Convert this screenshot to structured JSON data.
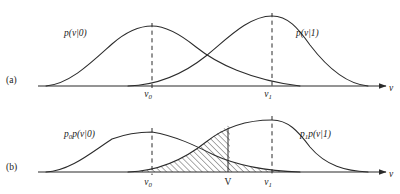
{
  "figure": {
    "kind": "probability-density-diagram",
    "background_color": "#ffffff",
    "ink_color": "#2b2b2b",
    "width": 400,
    "height": 194
  },
  "panels": [
    {
      "id": "a",
      "label": "(a)",
      "baseline_y": 86,
      "axis": {
        "label": "v",
        "x_start": 38,
        "x_end": 388,
        "arrow": true
      },
      "curves": [
        {
          "name": "p-v-given-0",
          "label_main": "p(v|0)",
          "label_x": 64,
          "label_y": 36,
          "peak_x": 152,
          "peak_y": 26,
          "left_foot_x": 46,
          "right_foot_x": 300
        },
        {
          "name": "p-v-given-1",
          "label_main": "p(v|1)",
          "label_x": 296,
          "label_y": 36,
          "peak_x": 272,
          "peak_y": 16,
          "left_foot_x": 128,
          "right_foot_x": 368
        }
      ],
      "markers": [
        {
          "name": "v0",
          "base": "v",
          "sub": "0",
          "x": 152,
          "tick_label_y": 97
        },
        {
          "name": "v1",
          "base": "v",
          "sub": "1",
          "x": 272,
          "tick_label_y": 97
        }
      ]
    },
    {
      "id": "b",
      "label": "(b)",
      "baseline_y": 172,
      "axis": {
        "label": "v",
        "x_start": 38,
        "x_end": 388,
        "arrow": true
      },
      "curves": [
        {
          "name": "p0-p-v-given-0",
          "label_main": "p",
          "label_sub": "0",
          "label_rest": "p(v|0)",
          "label_x": 64,
          "label_y": 137,
          "peak_x": 152,
          "peak_y": 132,
          "left_foot_x": 46,
          "right_foot_x": 300
        },
        {
          "name": "p1-p-v-given-1",
          "label_main": "p",
          "label_sub": "1",
          "label_rest": "p(v|1)",
          "label_x": 300,
          "label_y": 137,
          "peak_x": 272,
          "peak_y": 120,
          "left_foot_x": 128,
          "right_foot_x": 368
        }
      ],
      "threshold": {
        "name": "V",
        "label": "V",
        "x": 228,
        "tick_label_y": 185,
        "solid_line": true
      },
      "markers": [
        {
          "name": "v0",
          "base": "v",
          "sub": "0",
          "x": 152,
          "tick_label_y": 185
        },
        {
          "name": "v1",
          "base": "v",
          "sub": "1",
          "x": 272,
          "tick_label_y": 185
        }
      ],
      "shaded_regions": [
        {
          "name": "miss-region-left-of-threshold",
          "description": "area under p1 p(v|1) from its left foot to V",
          "hatch": "diagonal-up-right",
          "x_from": 128,
          "x_to": 228
        },
        {
          "name": "false-alarm-region-right-of-threshold",
          "description": "area under p0 p(v|0) from V to its right foot",
          "hatch": "diagonal-up-right",
          "x_from": 228,
          "x_to": 300
        }
      ]
    }
  ]
}
